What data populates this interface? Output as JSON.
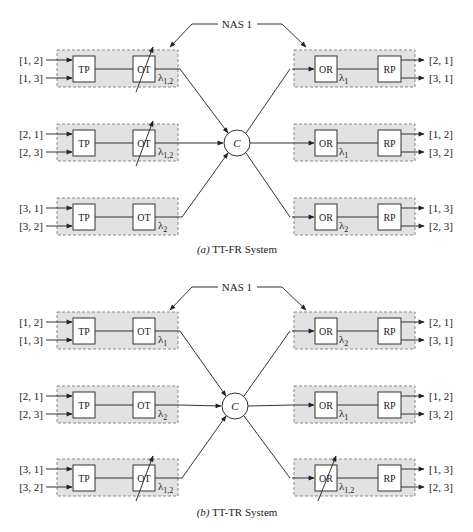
{
  "colors": {
    "shade": "#e2e2e2",
    "border": "#8a8a8a",
    "line": "#333333",
    "box": "#ffffff"
  },
  "diagrams": [
    {
      "id": "a",
      "nas_label": "NAS 1",
      "center_label": "C",
      "caption_prefix": "(a)",
      "caption_text": "TT-FR System",
      "transmitters": [
        {
          "inputs": [
            "[1, 2]",
            "[1, 3]"
          ],
          "tp": "TP",
          "ot": "OT",
          "lambda": "λ",
          "lambda_sub": "1,2",
          "tunable": true
        },
        {
          "inputs": [
            "[2, 1]",
            "[2, 3]"
          ],
          "tp": "TP",
          "ot": "OT",
          "lambda": "λ",
          "lambda_sub": "1,2",
          "tunable": true
        },
        {
          "inputs": [
            "[3, 1]",
            "[3, 2]"
          ],
          "tp": "TP",
          "ot": "OT",
          "lambda": "λ",
          "lambda_sub": "2",
          "tunable": false
        }
      ],
      "receivers": [
        {
          "outputs": [
            "[2, 1]",
            "[3, 1]"
          ],
          "or": "OR",
          "rp": "RP",
          "lambda": "λ",
          "lambda_sub": "1",
          "tunable": false
        },
        {
          "outputs": [
            "[1, 2]",
            "[3, 2]"
          ],
          "or": "OR",
          "rp": "RP",
          "lambda": "λ",
          "lambda_sub": "1",
          "tunable": false
        },
        {
          "outputs": [
            "[1, 3]",
            "[2, 3]"
          ],
          "or": "OR",
          "rp": "RP",
          "lambda": "λ",
          "lambda_sub": "2",
          "tunable": false
        }
      ]
    },
    {
      "id": "b",
      "nas_label": "NAS 1",
      "center_label": "C",
      "caption_prefix": "(b)",
      "caption_text": "TT-TR System",
      "transmitters": [
        {
          "inputs": [
            "[1, 2]",
            "[1, 3]"
          ],
          "tp": "TP",
          "ot": "OT",
          "lambda": "λ",
          "lambda_sub": "1",
          "tunable": false
        },
        {
          "inputs": [
            "[2, 1]",
            "[2, 3]"
          ],
          "tp": "TP",
          "ot": "OT",
          "lambda": "λ",
          "lambda_sub": "2",
          "tunable": false
        },
        {
          "inputs": [
            "[3, 1]",
            "[3, 2]"
          ],
          "tp": "TP",
          "ot": "OT",
          "lambda": "λ",
          "lambda_sub": "1,2",
          "tunable": true
        }
      ],
      "receivers": [
        {
          "outputs": [
            "[2, 1]",
            "[3, 1]"
          ],
          "or": "OR",
          "rp": "RP",
          "lambda": "λ",
          "lambda_sub": "2",
          "tunable": false
        },
        {
          "outputs": [
            "[1, 2]",
            "[3, 2]"
          ],
          "or": "OR",
          "rp": "RP",
          "lambda": "λ",
          "lambda_sub": "1",
          "tunable": false
        },
        {
          "outputs": [
            "[1, 3]",
            "[2, 3]"
          ],
          "or": "OR",
          "rp": "RP",
          "lambda": "λ",
          "lambda_sub": "1,2",
          "tunable": true
        }
      ]
    }
  ]
}
